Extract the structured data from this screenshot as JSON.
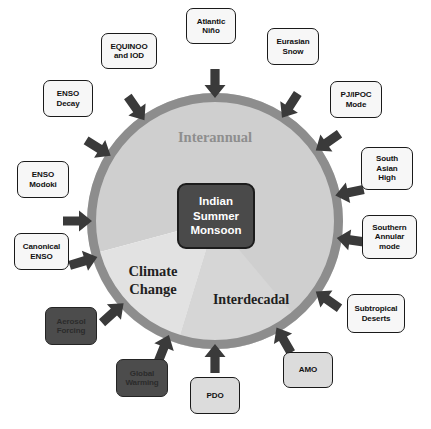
{
  "figure": {
    "background_color": "#ffffff"
  },
  "center": {
    "name": "indian-summer-monsoon",
    "lines": [
      "Indian",
      "Summer",
      "Monsoon"
    ],
    "fill_color": "#4a4a4a",
    "border_color": "#1c1c1c",
    "text_color": "#ffffff"
  },
  "circle": {
    "cx": 215,
    "cy": 221,
    "radius": 128,
    "ring_color": "#8d8d8d",
    "ring_width": 9
  },
  "sectors": [
    {
      "name": "interannual",
      "label": "Interannual",
      "fill_color": "#cfcfcf",
      "text_color": "#8e8e8e",
      "start_angle": 253,
      "end_angle": 195
    },
    {
      "name": "climate-change",
      "label_lines": [
        "Climate",
        "Change"
      ],
      "fill_color": "#e2e2e2",
      "text_color": "#1f1f1f",
      "start_angle": 195,
      "end_angle": 253
    },
    {
      "name": "interdecadal",
      "label": "Interdecadal",
      "fill_color": "#d6d6d6",
      "text_color": "#1f1f1f",
      "start_angle": 253,
      "end_angle": 310
    }
  ],
  "arrow_color": "#3a3a3a",
  "drivers": [
    {
      "name": "equinoo-and-iod",
      "lines": [
        "EQUINOO",
        "and IOD"
      ],
      "style": "light",
      "box": {
        "left": 101,
        "top": 33,
        "width": 56,
        "height": 36
      },
      "arrow_angle": 125
    },
    {
      "name": "atlantic-nino",
      "lines": [
        "Atlantic",
        "Niño"
      ],
      "style": "light",
      "box": {
        "left": 186,
        "top": 8,
        "width": 50,
        "height": 36
      },
      "arrow_angle": 90
    },
    {
      "name": "eurasian-snow",
      "lines": [
        "Eurasian",
        "Snow"
      ],
      "style": "light",
      "box": {
        "left": 267,
        "top": 28,
        "width": 52,
        "height": 37
      },
      "arrow_angle": 57
    },
    {
      "name": "pj-ipoc-mode",
      "lines": [
        "PJ/IPOC",
        "Mode"
      ],
      "style": "light",
      "box": {
        "left": 330,
        "top": 81,
        "width": 52,
        "height": 37
      },
      "arrow_angle": 35
    },
    {
      "name": "south-asian-high",
      "lines": [
        "South",
        "Asian",
        "High"
      ],
      "style": "light",
      "box": {
        "left": 361,
        "top": 147,
        "width": 52,
        "height": 43
      },
      "arrow_angle": 12
    },
    {
      "name": "southern-annular-mode",
      "lines": [
        "Southern",
        "Annular",
        "mode"
      ],
      "style": "light",
      "box": {
        "left": 362,
        "top": 215,
        "width": 55,
        "height": 44
      },
      "arrow_angle": 352
    },
    {
      "name": "subtropical-deserts",
      "lines": [
        "Subtropical",
        "Deserts"
      ],
      "style": "light",
      "box": {
        "left": 347,
        "top": 294,
        "width": 58,
        "height": 39
      },
      "arrow_angle": 325
    },
    {
      "name": "amo",
      "lines": [
        "AMO"
      ],
      "style": "gray",
      "box": {
        "left": 283,
        "top": 352,
        "width": 50,
        "height": 36
      },
      "arrow_angle": 300
    },
    {
      "name": "pdo",
      "lines": [
        "PDO"
      ],
      "style": "gray",
      "box": {
        "left": 190,
        "top": 377,
        "width": 50,
        "height": 37
      },
      "arrow_angle": 270
    },
    {
      "name": "global-warming",
      "lines": [
        "Global",
        "Warming"
      ],
      "style": "dark",
      "box": {
        "left": 116,
        "top": 359,
        "width": 52,
        "height": 38
      },
      "arrow_angle": 248
    },
    {
      "name": "aerosol-forcing",
      "lines": [
        "Aerosol",
        "Forcing"
      ],
      "style": "dark",
      "box": {
        "left": 45,
        "top": 307,
        "width": 52,
        "height": 38
      },
      "arrow_angle": 222
    },
    {
      "name": "canonical-enso",
      "lines": [
        "Canonical",
        "ENSO"
      ],
      "style": "light",
      "box": {
        "left": 14,
        "top": 233,
        "width": 55,
        "height": 37
      },
      "arrow_angle": 197
    },
    {
      "name": "enso-modoki",
      "lines": [
        "ENSO",
        "Modoki"
      ],
      "style": "light",
      "box": {
        "left": 17,
        "top": 161,
        "width": 52,
        "height": 37
      },
      "arrow_angle": 180
    },
    {
      "name": "enso-decay",
      "lines": [
        "ENSO",
        "Decay"
      ],
      "style": "light",
      "box": {
        "left": 43,
        "top": 80,
        "width": 50,
        "height": 37
      },
      "arrow_angle": 148
    }
  ]
}
